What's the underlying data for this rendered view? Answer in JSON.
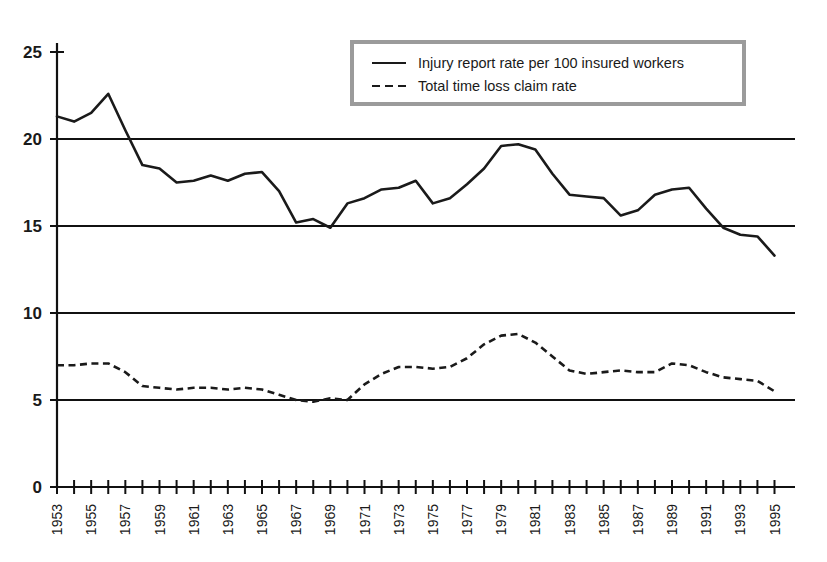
{
  "page": {
    "top_text_fragment": ""
  },
  "legend": {
    "position": "top-right",
    "entries": [
      {
        "label": "Injury report rate per 100 insured workers",
        "style": "solid"
      },
      {
        "label": "Total time loss claim rate",
        "style": "dashed"
      }
    ]
  },
  "axes": {
    "y_ticks": [
      "0",
      "5",
      "10",
      "15",
      "20",
      "25"
    ],
    "x_tick_labels": [
      "1953",
      "1955",
      "1957",
      "1959",
      "1961",
      "1963",
      "1965",
      "1967",
      "1969",
      "1971",
      "1973",
      "1975",
      "1977",
      "1979",
      "1981",
      "1983",
      "1985",
      "1987",
      "1989",
      "1991",
      "1993",
      "1995"
    ]
  },
  "colors": {
    "line": "#1a1a1a",
    "grid": "#111111",
    "legend_border": "#9b9b9b",
    "background": "#ffffff"
  },
  "chart_data": {
    "type": "line",
    "title": "",
    "subtitle": "",
    "xlabel": "",
    "ylabel": "",
    "xlim": [
      1953,
      1995
    ],
    "ylim": [
      0,
      25
    ],
    "yticks": [
      0,
      5,
      10,
      15,
      20,
      25
    ],
    "gridlines_y": [
      5,
      10,
      15,
      20
    ],
    "grid": true,
    "legend_position": "top-right",
    "x": [
      1953,
      1954,
      1955,
      1956,
      1957,
      1958,
      1959,
      1960,
      1961,
      1962,
      1963,
      1964,
      1965,
      1966,
      1967,
      1968,
      1969,
      1970,
      1971,
      1972,
      1973,
      1974,
      1975,
      1976,
      1977,
      1978,
      1979,
      1980,
      1981,
      1982,
      1983,
      1984,
      1985,
      1986,
      1987,
      1988,
      1989,
      1990,
      1991,
      1992,
      1993,
      1994,
      1995
    ],
    "series": [
      {
        "name": "Injury report rate per 100 insured workers",
        "style": "solid",
        "values": [
          21.3,
          21.0,
          21.5,
          22.6,
          20.5,
          18.5,
          18.3,
          17.5,
          17.6,
          17.9,
          17.6,
          18.0,
          18.1,
          17.0,
          15.2,
          15.4,
          14.9,
          16.3,
          16.6,
          17.1,
          17.2,
          17.6,
          16.3,
          16.6,
          17.4,
          18.3,
          19.6,
          19.7,
          19.4,
          18.0,
          16.8,
          16.7,
          16.6,
          15.6,
          15.9,
          16.8,
          17.1,
          17.2,
          16.0,
          14.9,
          14.5,
          14.4,
          13.3
        ]
      },
      {
        "name": "Total time loss claim rate",
        "style": "dashed",
        "values": [
          7.0,
          7.0,
          7.1,
          7.1,
          6.6,
          5.8,
          5.7,
          5.6,
          5.7,
          5.7,
          5.6,
          5.7,
          5.6,
          5.3,
          5.0,
          4.9,
          5.1,
          5.0,
          5.9,
          6.5,
          6.9,
          6.9,
          6.8,
          6.9,
          7.4,
          8.2,
          8.7,
          8.8,
          8.3,
          7.5,
          6.7,
          6.5,
          6.6,
          6.7,
          6.6,
          6.6,
          7.1,
          7.0,
          6.6,
          6.3,
          6.2,
          6.1,
          5.5
        ]
      }
    ]
  }
}
